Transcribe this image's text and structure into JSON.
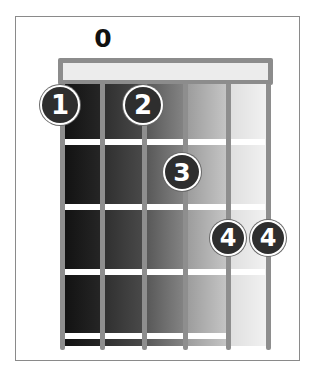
{
  "diagram": {
    "type": "chord-chart",
    "open_string_marker": {
      "label": "0",
      "string": 2
    },
    "strings": 6,
    "frets": 4,
    "fingers": [
      {
        "label": "1",
        "string": 1,
        "fret": 1
      },
      {
        "label": "2",
        "string": 3,
        "fret": 1
      },
      {
        "label": "3",
        "string": 4,
        "fret": 2
      },
      {
        "label": "4",
        "string": 5,
        "fret": 3
      },
      {
        "label": "4",
        "string": 6,
        "fret": 3
      }
    ],
    "column_shades": [
      "#1c1c1c",
      "#3c3c3c",
      "#6a6a6a",
      "#a8a8a8",
      "#e6e6e6"
    ],
    "colors": {
      "frame": "#8a8a8a",
      "string": "#8e8e8e",
      "fret": "#ffffff",
      "finger_fill": "#2e2e2e",
      "finger_text": "#ffffff"
    }
  }
}
